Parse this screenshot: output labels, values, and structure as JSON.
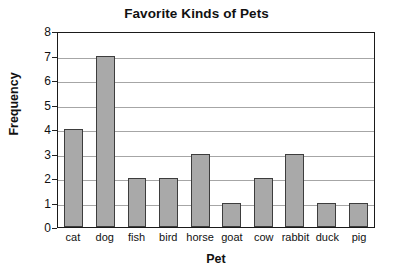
{
  "chart_data": {
    "type": "bar",
    "title": "Favorite Kinds of Pets",
    "xlabel": "Pet",
    "ylabel": "Frequency",
    "categories": [
      "cat",
      "dog",
      "fish",
      "bird",
      "horse",
      "goat",
      "cow",
      "rabbit",
      "duck",
      "pig"
    ],
    "values": [
      4,
      7,
      2,
      2,
      3,
      1,
      2,
      3,
      1,
      1
    ],
    "ylim": [
      0,
      8
    ],
    "y_ticks": [
      8,
      7,
      6,
      5,
      4,
      3,
      2,
      1,
      0
    ],
    "grid": true,
    "legend": "none",
    "bar_color": "#a9a9a9",
    "bar_border_color": "#3d3d3d",
    "gridline_color": "#a6a6a6",
    "axis_color": "#1a1a1a",
    "background_color": "#ffffff"
  }
}
